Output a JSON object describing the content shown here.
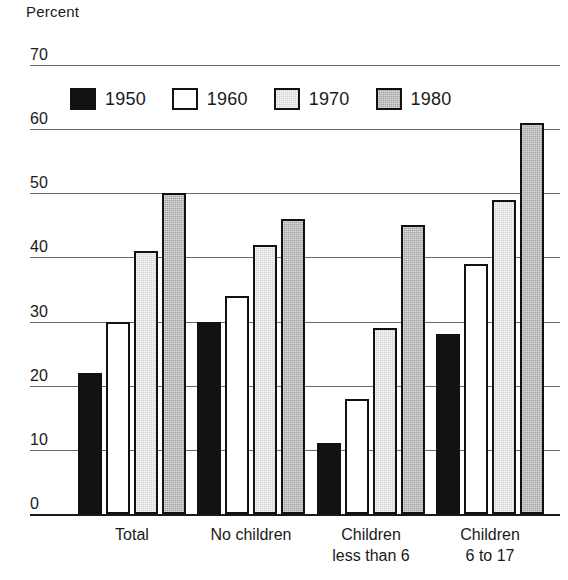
{
  "chart_data": {
    "type": "bar",
    "title": "",
    "ylabel": "Percent",
    "xlabel": "",
    "ylim": [
      0,
      70
    ],
    "yticks": [
      0,
      10,
      20,
      30,
      40,
      50,
      60,
      70
    ],
    "grid": true,
    "legend_position": "upper-left-inside",
    "categories": [
      "Total",
      "No children",
      "Children less than 6",
      "Children 6 to 17"
    ],
    "category_lines": [
      [
        "Total",
        ""
      ],
      [
        "No children",
        ""
      ],
      [
        "Children",
        "less than 6"
      ],
      [
        "Children",
        "6 to 17"
      ]
    ],
    "series": [
      {
        "name": "1950",
        "color": "#121212",
        "values": [
          22,
          30,
          11,
          28
        ]
      },
      {
        "name": "1960",
        "color": "#ffffff",
        "values": [
          30,
          34,
          18,
          39
        ]
      },
      {
        "name": "1970",
        "color": "#d2d2d2",
        "values": [
          41,
          42,
          29,
          49
        ]
      },
      {
        "name": "1980",
        "color": "#a3a3a3",
        "values": [
          50,
          46,
          45,
          61
        ]
      }
    ]
  },
  "axis": {
    "percent_label": "Percent"
  },
  "legend": {
    "items": [
      {
        "label": "1950",
        "swatch": "black-filled-swatch"
      },
      {
        "label": "1960",
        "swatch": "white-filled-swatch"
      },
      {
        "label": "1970",
        "swatch": "light-gray-filled-swatch"
      },
      {
        "label": "1980",
        "swatch": "medium-gray-filled-swatch"
      }
    ]
  }
}
